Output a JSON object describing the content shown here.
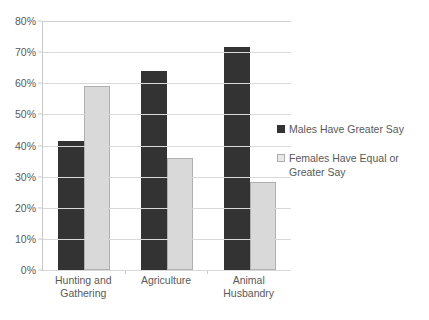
{
  "chart_data": {
    "type": "bar",
    "title": "",
    "subtitle": "",
    "xlabel": "",
    "ylabel": "",
    "categories": [
      "Hunting and Gathering",
      "Agriculture",
      "Animal Husbandry"
    ],
    "series": [
      {
        "name": "Males Have Greater Say",
        "color": "#333333",
        "values": [
          41.5,
          64.0,
          71.7
        ]
      },
      {
        "name": "Females Have Equal or Greater Say",
        "color": "#d9d9d9",
        "values": [
          59.0,
          36.0,
          28.3
        ]
      }
    ],
    "ylim": [
      0,
      80
    ],
    "ytick_values": [
      0,
      10,
      20,
      30,
      40,
      50,
      60,
      70,
      80
    ],
    "ytick_labels": [
      "0%",
      "10%",
      "20%",
      "30%",
      "40%",
      "50%",
      "60%",
      "70%",
      "80%"
    ],
    "grid": "horizontal",
    "legend_position": "right"
  },
  "axes": {
    "y_ticks": [
      {
        "label": "80%",
        "value": 80
      },
      {
        "label": "70%",
        "value": 70
      },
      {
        "label": "60%",
        "value": 60
      },
      {
        "label": "50%",
        "value": 50
      },
      {
        "label": "40%",
        "value": 40
      },
      {
        "label": "30%",
        "value": 30
      },
      {
        "label": "20%",
        "value": 20
      },
      {
        "label": "10%",
        "value": 10
      },
      {
        "label": "0%",
        "value": 0
      }
    ],
    "x_categories": [
      {
        "label": "Hunting and Gathering"
      },
      {
        "label": "Agriculture"
      },
      {
        "label": "Animal Husbandry"
      }
    ]
  },
  "legend": {
    "items": [
      {
        "label": "Males Have Greater Say",
        "color": "#333333"
      },
      {
        "label": "Females Have Equal or Greater Say",
        "color": "#d9d9d9"
      }
    ]
  },
  "colors": {
    "series_dark": "#333333",
    "series_light": "#d9d9d9",
    "gridline": "#d9d9d9",
    "axis": "#a6a6a6",
    "text": "#595959",
    "background": "#ffffff"
  }
}
